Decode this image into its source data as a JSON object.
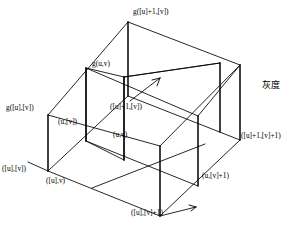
{
  "figure": {
    "type": "3d-wireframe-bilinear-interpolation",
    "axis_label_vertical": "灰度",
    "stroke_color": "#000000",
    "background_color": "#ffffff",
    "labels": {
      "g_top_corner": "g([u]+1,[v])",
      "g_interior": "g(u,v)",
      "g_left_corner": "g([u],[v])",
      "p_u_floorv": "(u,[v])",
      "p_floorU1_floorV": "([u]+1,[v])",
      "p_u_v": "(u,v)",
      "p_floorU1_floorV1": "([u]+1,[v]+1)",
      "p_floorU_floorV": "([u],[v])",
      "p_floorU_v": "([u],v)",
      "p_u_floorV1": "(u,[v]+1)",
      "p_floorU_floorV1": "([u],[v]+1)"
    }
  }
}
